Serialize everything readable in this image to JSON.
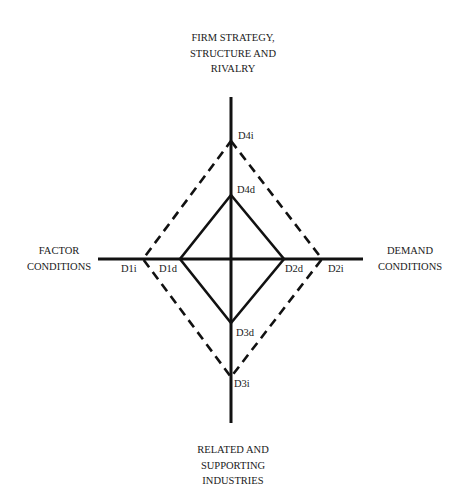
{
  "diagram": {
    "type": "diamond",
    "top_label": [
      "FIRM STRATEGY,",
      "STRUCTURE AND",
      "RIVALRY"
    ],
    "left_label": [
      "FACTOR",
      "CONDITIONS"
    ],
    "right_label": [
      "DEMAND",
      "CONDITIONS"
    ],
    "bottom_label": [
      "RELATED AND",
      "SUPPORTING",
      "INDUSTRIES"
    ],
    "points": {
      "D1i": "D1i",
      "D1d": "D1d",
      "D2d": "D2d",
      "D2i": "D2i",
      "D3d": "D3d",
      "D3i": "D3i",
      "D4d": "D4d",
      "D4i": "D4i"
    },
    "line_color": "#111111"
  }
}
